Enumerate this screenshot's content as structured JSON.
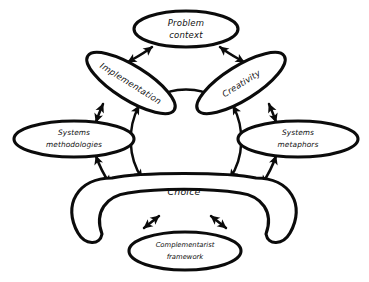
{
  "diagram": {
    "style": {
      "background": "#ffffff",
      "stroke": "#0b0b0b",
      "fill": "#ffffff",
      "text": "#111111"
    },
    "nodes": [
      {
        "id": "problem-context",
        "label_lines": [
          "Problem",
          "context"
        ],
        "line1": "Problem",
        "line2": "context",
        "shape": "ellipse"
      },
      {
        "id": "implementation",
        "label_lines": [
          "Implementation"
        ],
        "line1": "Implementation",
        "shape": "ellipse-rotated"
      },
      {
        "id": "creativity",
        "label_lines": [
          "Creativity"
        ],
        "line1": "Creativity",
        "shape": "ellipse-rotated"
      },
      {
        "id": "systems-methodologies",
        "label_lines": [
          "Systems",
          "methodologies"
        ],
        "line1": "Systems",
        "line2": "methodologies",
        "shape": "ellipse"
      },
      {
        "id": "systems-metaphors",
        "label_lines": [
          "Systems",
          "metaphors"
        ],
        "line1": "Systems",
        "line2": "metaphors",
        "shape": "ellipse"
      },
      {
        "id": "choice",
        "label_lines": [
          "Choice"
        ],
        "line1": "Choice",
        "shape": "crescent"
      },
      {
        "id": "complementarist-framework",
        "label_lines": [
          "Complementarist",
          "framework"
        ],
        "line1": "Complementarist",
        "line2": "framework",
        "shape": "ellipse"
      }
    ],
    "edges": [
      {
        "id": "problem-context--implementation",
        "from": "problem-context",
        "to": "implementation",
        "arrows": "both"
      },
      {
        "id": "problem-context--creativity",
        "from": "problem-context",
        "to": "creativity",
        "arrows": "both"
      },
      {
        "id": "implementation--creativity",
        "from": "implementation",
        "to": "creativity",
        "arrows": "both"
      },
      {
        "id": "implementation--systems-methodologies",
        "from": "implementation",
        "to": "systems-methodologies",
        "arrows": "both"
      },
      {
        "id": "creativity--systems-metaphors",
        "from": "creativity",
        "to": "systems-metaphors",
        "arrows": "both"
      },
      {
        "id": "implementation--choice",
        "from": "implementation",
        "to": "choice",
        "arrows": "both"
      },
      {
        "id": "creativity--choice",
        "from": "creativity",
        "to": "choice",
        "arrows": "both"
      },
      {
        "id": "systems-methodologies--choice",
        "from": "systems-methodologies",
        "to": "choice",
        "arrows": "both"
      },
      {
        "id": "systems-metaphors--choice",
        "from": "systems-metaphors",
        "to": "choice",
        "arrows": "both"
      },
      {
        "id": "choice--complementarist-framework-left",
        "from": "choice",
        "to": "complementarist-framework",
        "arrows": "both"
      },
      {
        "id": "choice--complementarist-framework-right",
        "from": "choice",
        "to": "complementarist-framework",
        "arrows": "both"
      }
    ]
  }
}
